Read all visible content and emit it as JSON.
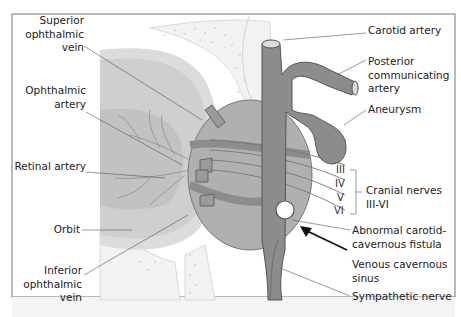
{
  "diagram": {
    "colors": {
      "frame": "#777777",
      "orbit_fill": "#c9c9c9",
      "orbit_light": "#dedede",
      "sinus_fill": "#a8a8a8",
      "vessel_fill": "#8c8c8c",
      "vessel_stroke": "#555555",
      "bone_fill": "#f1f1f1",
      "label_text": "#222222",
      "leader_line": "#555555"
    },
    "labels": {
      "superior_ophthalmic_vein": "Superior\nophthalmic\nvein",
      "ophthalmic_artery": "Ophthalmic\nartery",
      "retinal_artery": "Retinal artery",
      "orbit": "Orbit",
      "inferior_ophthalmic_vein": "Inferior\nophthalmic\nvein",
      "carotid_artery": "Carotid artery",
      "posterior_communicating_artery": "Posterior\ncommunicating\nartery",
      "aneurysm": "Aneurysm",
      "cranial_nerves": "Cranial nerves\nIII-VI",
      "abnormal_fistula": "Abnormal carotid-\ncavernous fistula",
      "venous_cavernous_sinus": "Venous cavernous\nsinus",
      "sympathetic_nerve": "Sympathetic nerve"
    },
    "nerves": [
      "III",
      "IV",
      "V",
      "VI"
    ]
  }
}
